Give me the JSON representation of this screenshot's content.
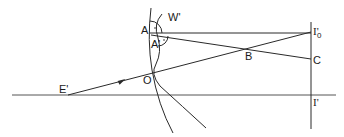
{
  "diagram": {
    "type": "geometric-optics-ray-diagram",
    "colors": {
      "stroke": "#2a2a2a",
      "axis": "#555555",
      "background": "#ffffff"
    },
    "labels": {
      "A": "A",
      "A_prime": "A'",
      "W_prime": "W'",
      "O": "O",
      "B": "B",
      "C": "C",
      "E_prime": "E'",
      "I_prime_0_main": "I'",
      "I_prime_0_sub": "0",
      "I_prime": "I'"
    },
    "elements": {
      "optical_axis": "horizontal axis line",
      "image_plane": "vertical line through I'0 and I'",
      "surface": "curved refracting surface through A and O",
      "wavefront": "curved wavefront W' through A'",
      "ray_E_to_I0": "ray from E' through O to I'0 with arrow",
      "ray_A_to_I0": "horizontal ray from A to I'0",
      "ray_A_prime_to_C": "ray from A' through B to C"
    }
  }
}
